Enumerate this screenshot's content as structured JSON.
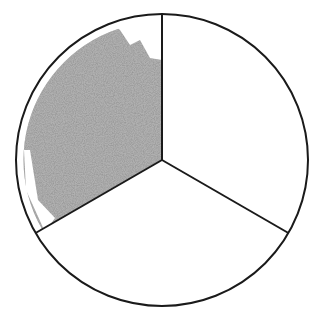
{
  "diagram": {
    "type": "fraction-circle",
    "parts_total": 3,
    "parts_shaded": 1,
    "fraction": "1/3",
    "colors": {
      "outline": "#1a1a1a",
      "shade": "#8c8c8c",
      "background": "#ffffff"
    }
  }
}
